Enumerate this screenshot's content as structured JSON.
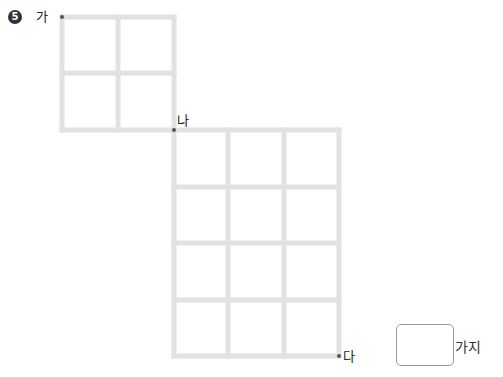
{
  "problem": {
    "number": "5",
    "points": {
      "start": "가",
      "middle": "나",
      "end": "다"
    },
    "answer_value": "",
    "answer_unit": "가지"
  },
  "grids": [
    {
      "name": "small",
      "cols": 2,
      "rows": 2
    },
    {
      "name": "large",
      "cols": 3,
      "rows": 4
    }
  ],
  "colors": {
    "line": "#e2e2e2",
    "point": "#555555"
  }
}
